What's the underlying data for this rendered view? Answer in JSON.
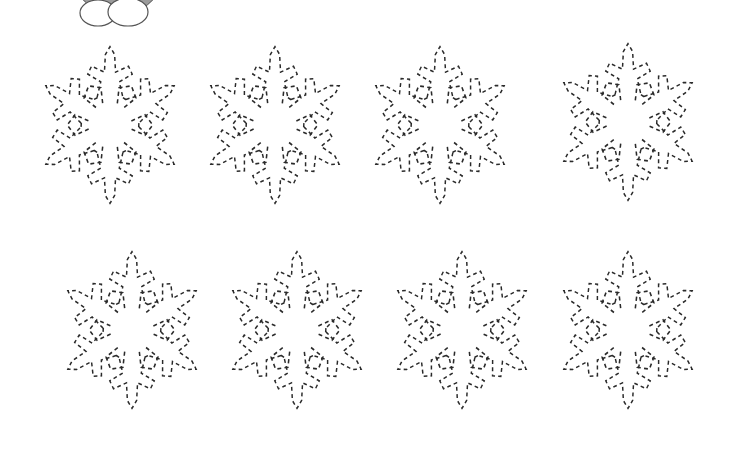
{
  "worksheet": {
    "type": "tracing-worksheet",
    "subject": "snowflakes",
    "line_style": "dashed",
    "line_color": "#2a2a2a",
    "background": "#ffffff"
  },
  "mascot": {
    "name": "penguin-cartoon",
    "body_color": "#9b9b9b",
    "feet_color": "#ffffff",
    "cropped": true
  },
  "snowflakes": [
    {
      "row": 1,
      "col": 1,
      "cx": 110,
      "cy": 125
    },
    {
      "row": 1,
      "col": 2,
      "cx": 275,
      "cy": 125
    },
    {
      "row": 1,
      "col": 3,
      "cx": 440,
      "cy": 125
    },
    {
      "row": 1,
      "col": 4,
      "cx": 628,
      "cy": 122
    },
    {
      "row": 2,
      "col": 1,
      "cx": 132,
      "cy": 330
    },
    {
      "row": 2,
      "col": 2,
      "cx": 297,
      "cy": 330
    },
    {
      "row": 2,
      "col": 3,
      "cx": 462,
      "cy": 330
    },
    {
      "row": 2,
      "col": 4,
      "cx": 628,
      "cy": 330
    }
  ],
  "snowflake_size": {
    "rx": 74,
    "ry": 94
  }
}
